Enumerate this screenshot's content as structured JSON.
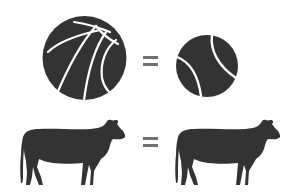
{
  "colors": {
    "background": "#ffffff",
    "icon_fill": "#333333",
    "seam": "#ffffff",
    "equals": "#707070"
  },
  "rows": [
    {
      "left": {
        "icon": "basketball-icon",
        "label": "basketball"
      },
      "operator": "=",
      "right": {
        "icon": "tennis-ball-icon",
        "label": "tennis ball"
      }
    },
    {
      "left": {
        "icon": "cow-icon",
        "label": "cow"
      },
      "operator": "=",
      "right": {
        "icon": "cow-icon",
        "label": "cow"
      }
    }
  ]
}
